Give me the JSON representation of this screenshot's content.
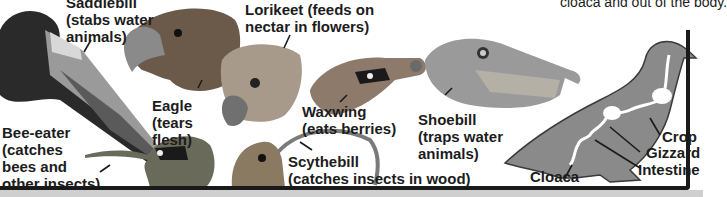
{
  "caption_fragment": "cloaca and out of the body.",
  "beaks": [
    {
      "id": "saddlebill",
      "name": "Saddlebill",
      "desc": "(stabs water\nanimals)",
      "label": "Saddlebill\n(stabs water\nanimals)"
    },
    {
      "id": "eagle",
      "name": "Eagle",
      "label": "Eagle\n(tears\nflesh)"
    },
    {
      "id": "lorikeet",
      "name": "Lorikeet",
      "label": "Lorikeet (feeds on\nnectar in flowers)"
    },
    {
      "id": "waxwing",
      "name": "Waxwing",
      "label": "Waxwing\n(eats berries)"
    },
    {
      "id": "shoebill",
      "name": "Shoebill",
      "label": "Shoebill\n(traps water\nanimals)"
    },
    {
      "id": "bee-eater",
      "name": "Bee-eater",
      "label": "Bee-eater\n(catches\nbees and\nother insects)"
    },
    {
      "id": "scythebill",
      "name": "Scythebill",
      "label": "Scythebill\n(catches insects in wood)"
    }
  ],
  "digestive_diagram": {
    "labels": {
      "crop": "Crop",
      "gizzard": "Gizzard",
      "intestine": "Intestine",
      "cloaca": "Cloaca"
    },
    "colors": {
      "body": "#8a8a8a",
      "tract": "#ffffff",
      "outline": "#3a3a3a"
    }
  }
}
